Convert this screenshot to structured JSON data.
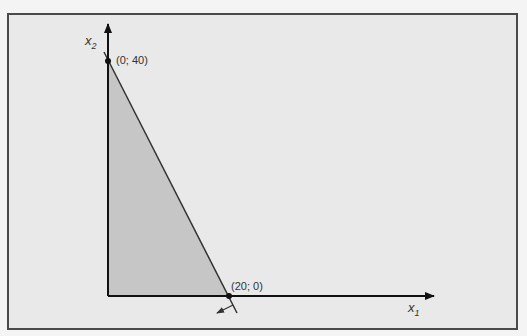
{
  "diagram": {
    "type": "linear-programming-feasible-region",
    "axes": {
      "x": {
        "label": "x",
        "subscript": "1"
      },
      "y": {
        "label": "x",
        "subscript": "2"
      }
    },
    "points": [
      {
        "label": "(0; 40)",
        "x": 0,
        "y": 40
      },
      {
        "label": "(20; 0)",
        "x": 20,
        "y": 0
      }
    ],
    "region": {
      "description": "feasible region: triangle with vertices (0;0), (0;40), (20;0)",
      "fill": "#c8c8c8"
    },
    "constraint_line": {
      "from": "(0; 40)",
      "to": "(20; 0)",
      "direction_arrow": "toward origin"
    },
    "colors": {
      "background": "#e9e9e9",
      "frame": "#4a4a4a",
      "axis": "#111111",
      "region": "#c8c8c8"
    }
  }
}
